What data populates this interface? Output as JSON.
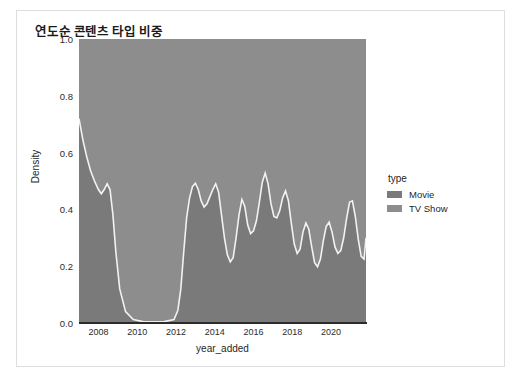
{
  "figure": {
    "title": "연도순 콘텐츠 타입 비중",
    "background": "#ffffff",
    "border_color": "#dedede"
  },
  "legend": {
    "title": "type",
    "position": "right",
    "entries": [
      {
        "label": "Movie",
        "color": "#7a7a7a"
      },
      {
        "label": "TV Show",
        "color": "#8d8d8d"
      }
    ]
  },
  "chart_data": {
    "type": "area",
    "title": "연도순 콘텐츠 타입 비중",
    "xlabel": "year_added",
    "ylabel": "Density",
    "xlim": [
      2007.0,
      2021.8
    ],
    "ylim": [
      0.0,
      1.0
    ],
    "grid": false,
    "stacked": true,
    "normalized": true,
    "xticks": [
      2008,
      2010,
      2012,
      2014,
      2016,
      2018,
      2020
    ],
    "xtick_labels": [
      "2008",
      "2010",
      "2012",
      "2014",
      "2016",
      "2018",
      "2020"
    ],
    "yticks": [
      0.0,
      0.2,
      0.4,
      0.6,
      0.8,
      1.0
    ],
    "ytick_labels": [
      "0.0",
      "0.2",
      "0.4",
      "0.6",
      "0.8",
      "1.0"
    ],
    "series": [
      {
        "name": "Movie",
        "color": "#7a7a7a",
        "note": "lower band: area from 0 up to the boundary curve",
        "x": [
          2007.0,
          2007.2,
          2007.4,
          2007.6,
          2007.8,
          2008.0,
          2008.15,
          2008.3,
          2008.45,
          2008.6,
          2008.75,
          2008.9,
          2009.1,
          2009.4,
          2009.8,
          2010.3,
          2010.9,
          2011.4,
          2011.9,
          2012.1,
          2012.25,
          2012.4,
          2012.55,
          2012.7,
          2012.85,
          2013.0,
          2013.15,
          2013.3,
          2013.45,
          2013.6,
          2013.75,
          2013.9,
          2014.05,
          2014.2,
          2014.35,
          2014.5,
          2014.65,
          2014.8,
          2014.95,
          2015.1,
          2015.25,
          2015.4,
          2015.55,
          2015.7,
          2015.85,
          2016.0,
          2016.15,
          2016.3,
          2016.45,
          2016.6,
          2016.75,
          2016.9,
          2017.05,
          2017.2,
          2017.35,
          2017.5,
          2017.65,
          2017.8,
          2017.95,
          2018.1,
          2018.25,
          2018.4,
          2018.55,
          2018.7,
          2018.85,
          2019.0,
          2019.15,
          2019.3,
          2019.45,
          2019.6,
          2019.75,
          2019.9,
          2020.05,
          2020.2,
          2020.35,
          2020.5,
          2020.65,
          2020.8,
          2020.95,
          2021.1,
          2021.25,
          2021.4,
          2021.55,
          2021.7,
          2021.8
        ],
        "y": [
          0.72,
          0.645,
          0.585,
          0.535,
          0.5,
          0.47,
          0.455,
          0.47,
          0.49,
          0.47,
          0.38,
          0.25,
          0.12,
          0.04,
          0.012,
          0.005,
          0.004,
          0.005,
          0.012,
          0.045,
          0.12,
          0.25,
          0.37,
          0.44,
          0.48,
          0.492,
          0.47,
          0.43,
          0.408,
          0.42,
          0.445,
          0.47,
          0.49,
          0.46,
          0.38,
          0.3,
          0.24,
          0.215,
          0.23,
          0.3,
          0.38,
          0.435,
          0.41,
          0.345,
          0.315,
          0.325,
          0.36,
          0.425,
          0.495,
          0.528,
          0.49,
          0.42,
          0.375,
          0.37,
          0.395,
          0.44,
          0.465,
          0.43,
          0.35,
          0.278,
          0.245,
          0.26,
          0.32,
          0.352,
          0.33,
          0.268,
          0.212,
          0.198,
          0.225,
          0.29,
          0.34,
          0.355,
          0.32,
          0.268,
          0.245,
          0.255,
          0.3,
          0.368,
          0.425,
          0.43,
          0.375,
          0.295,
          0.235,
          0.225,
          0.3
        ]
      },
      {
        "name": "TV Show",
        "color": "#8d8d8d",
        "note": "upper band: area from the boundary curve up to 1.0",
        "fills_to": 1.0
      }
    ],
    "boundary_line_color": "#f2f2f2"
  }
}
